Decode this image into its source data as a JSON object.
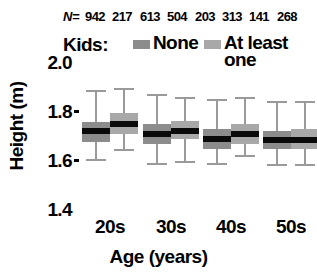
{
  "chart_data": {
    "type": "boxplot",
    "title": "",
    "xlabel": "Age (years)",
    "ylabel": "Height (m)",
    "categories": [
      "20s",
      "30s",
      "40s",
      "50s"
    ],
    "ylim": [
      1.4,
      2.0
    ],
    "yticks": [
      "1.4",
      "1.6",
      "1.8",
      "2.0"
    ],
    "ytick_values": [
      1.4,
      1.6,
      1.8,
      2.0
    ],
    "grid": false,
    "legend_position": "top",
    "n_label": "N=",
    "n_values": [
      942,
      217,
      613,
      504,
      203,
      313,
      141,
      268
    ],
    "legend_title": "Kids:",
    "series": [
      {
        "name": "None",
        "color": "#8c8c8c",
        "boxes": [
          {
            "category": "20s",
            "n": 942,
            "whisker_low": 1.6,
            "q1": 1.675,
            "median": 1.72,
            "q3": 1.755,
            "whisker_high": 1.88
          },
          {
            "category": "30s",
            "n": 613,
            "whisker_low": 1.585,
            "q1": 1.665,
            "median": 1.705,
            "q3": 1.745,
            "whisker_high": 1.865
          },
          {
            "category": "40s",
            "n": 203,
            "whisker_low": 1.585,
            "q1": 1.645,
            "median": 1.685,
            "q3": 1.725,
            "whisker_high": 1.845
          },
          {
            "category": "50s",
            "n": 141,
            "whisker_low": 1.58,
            "q1": 1.645,
            "median": 1.68,
            "q3": 1.72,
            "whisker_high": 1.835
          }
        ]
      },
      {
        "name": "At least\none",
        "color": "#a8a8a8",
        "boxes": [
          {
            "category": "20s",
            "n": 217,
            "whisker_low": 1.64,
            "q1": 1.705,
            "median": 1.745,
            "q3": 1.79,
            "whisker_high": 1.89
          },
          {
            "category": "30s",
            "n": 504,
            "whisker_low": 1.59,
            "q1": 1.685,
            "median": 1.72,
            "q3": 1.76,
            "whisker_high": 1.855
          },
          {
            "category": "40s",
            "n": 313,
            "whisker_low": 1.615,
            "q1": 1.665,
            "median": 1.705,
            "q3": 1.745,
            "whisker_high": 1.855
          },
          {
            "category": "50s",
            "n": 268,
            "whisker_low": 1.58,
            "q1": 1.645,
            "median": 1.68,
            "q3": 1.725,
            "whisker_high": 1.835
          }
        ]
      }
    ]
  },
  "colors": {
    "none_swatch": "#8c8c8c",
    "atleast_swatch": "#a8a8a8",
    "median": "#0a0a0a",
    "whisker": "#9a9a9a",
    "text": "#000000"
  }
}
